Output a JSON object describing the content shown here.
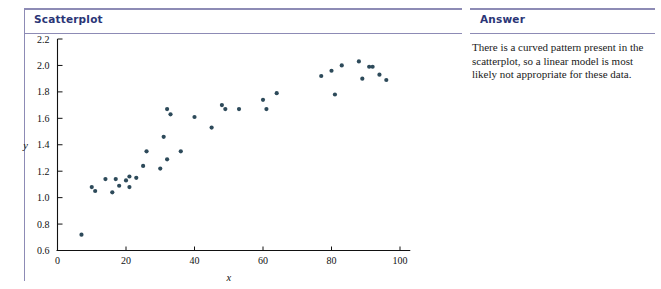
{
  "colors": {
    "rule": "#8d8bb5",
    "heading_text": "#2b3576",
    "point": "#2d4a5a",
    "axis": "#111111",
    "body_text": "#1a1a1a"
  },
  "left_panel": {
    "heading": "Scatterplot"
  },
  "right_panel": {
    "heading": "Answer",
    "body": "There is a curved pattern present in the scatterplot, so a linear model is most likely not appropriate for these data."
  },
  "chart_data": {
    "type": "scatter",
    "title": "",
    "xlabel": "x",
    "ylabel": "y",
    "xlim": [
      0,
      103
    ],
    "ylim": [
      0.6,
      2.2
    ],
    "xticks": [
      0,
      20,
      40,
      60,
      80,
      100
    ],
    "yticks": [
      0.6,
      0.8,
      1.0,
      1.2,
      1.4,
      1.6,
      1.8,
      2.0,
      2.2
    ],
    "xtick_labels": [
      "0",
      "20",
      "40",
      "60",
      "80",
      "100"
    ],
    "ytick_labels": [
      "0.6",
      "0.8",
      "1.0",
      "1.2",
      "1.4",
      "1.6",
      "1.8",
      "2.0",
      "2.2"
    ],
    "grid": false,
    "legend": null,
    "points": [
      [
        7,
        0.72
      ],
      [
        10,
        1.08
      ],
      [
        11,
        1.05
      ],
      [
        14,
        1.14
      ],
      [
        16,
        1.04
      ],
      [
        17,
        1.14
      ],
      [
        18,
        1.09
      ],
      [
        20,
        1.13
      ],
      [
        21,
        1.16
      ],
      [
        21,
        1.08
      ],
      [
        23,
        1.15
      ],
      [
        25,
        1.24
      ],
      [
        26,
        1.35
      ],
      [
        30,
        1.22
      ],
      [
        31,
        1.46
      ],
      [
        32,
        1.67
      ],
      [
        32,
        1.29
      ],
      [
        33,
        1.63
      ],
      [
        36,
        1.35
      ],
      [
        40,
        1.61
      ],
      [
        45,
        1.53
      ],
      [
        48,
        1.7
      ],
      [
        49,
        1.67
      ],
      [
        53,
        1.67
      ],
      [
        60,
        1.74
      ],
      [
        61,
        1.67
      ],
      [
        64,
        1.79
      ],
      [
        77,
        1.92
      ],
      [
        80,
        1.96
      ],
      [
        81,
        1.78
      ],
      [
        83,
        2.0
      ],
      [
        88,
        2.03
      ],
      [
        89,
        1.9
      ],
      [
        91,
        1.99
      ],
      [
        92,
        1.99
      ],
      [
        94,
        1.93
      ],
      [
        96,
        1.89
      ]
    ]
  }
}
